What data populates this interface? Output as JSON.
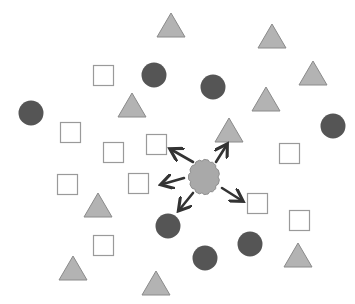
{
  "diagram": {
    "colors": {
      "background": "#ffffff",
      "circle_fill": "#555555",
      "triangle_fill": "#b3b3b3",
      "triangle_stroke": "#8a8a8a",
      "square_fill": "#ffffff",
      "square_stroke": "#9a9a9a",
      "cloud_fill": "#a9a9a9",
      "cloud_stroke": "#8f8f8f",
      "arrow_color": "#333333"
    },
    "shape_counts": {
      "squares": 13,
      "circles": 9,
      "triangles": 11,
      "clouds": 1,
      "arrows": 5
    },
    "arrow_targets": [
      "square",
      "triangle",
      "square",
      "circle",
      "square"
    ]
  }
}
